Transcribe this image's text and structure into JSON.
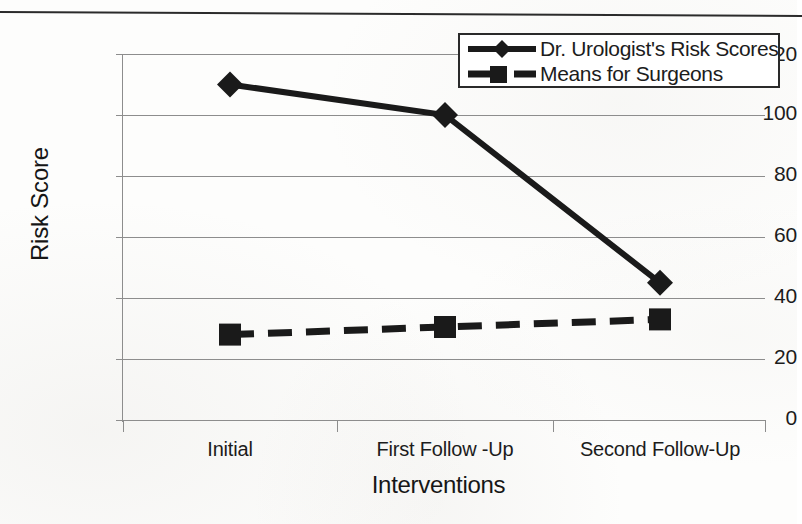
{
  "chart_data": {
    "type": "line",
    "title": "",
    "xlabel": "Interventions",
    "ylabel": "Risk Score",
    "categories": [
      "Initial",
      "First Follow -Up",
      "Second Follow-Up"
    ],
    "ylim": [
      0,
      120
    ],
    "yticks": [
      "0",
      "20",
      "40",
      "60",
      "80",
      "100",
      "120"
    ],
    "grid": "horizontal",
    "legend_position": "top-right",
    "series": [
      {
        "name": "Dr. Urologist's Risk Scores",
        "values": [
          110,
          100,
          45
        ],
        "marker": "diamond",
        "line_style": "solid",
        "color": "#1a1a1a"
      },
      {
        "name": "Means for Surgeons",
        "values": [
          28,
          30.5,
          33
        ],
        "marker": "square",
        "line_style": "dashed",
        "color": "#1a1a1a"
      }
    ]
  },
  "axes": {
    "y_label": "Risk Score",
    "x_label": "Interventions",
    "y_ticks": [
      {
        "label": "120",
        "value": 120
      },
      {
        "label": "100",
        "value": 100
      },
      {
        "label": "80",
        "value": 80
      },
      {
        "label": "60",
        "value": 60
      },
      {
        "label": "40",
        "value": 40
      },
      {
        "label": "20",
        "value": 20
      },
      {
        "label": "0",
        "value": 0
      }
    ],
    "x_ticks": [
      {
        "label": "Initial"
      },
      {
        "label": "First Follow -Up"
      },
      {
        "label": "Second Follow-Up"
      }
    ]
  },
  "legend": {
    "entries": [
      {
        "label": "Dr. Urologist's Risk Scores",
        "marker": "diamond-marker",
        "line": "solid"
      },
      {
        "label": "Means for Surgeons",
        "marker": "square-marker",
        "line": "dashed"
      }
    ]
  },
  "colors": {
    "ink": "#1a1a1a",
    "grid": "#8d8d8d",
    "page": "#fdfdfc"
  }
}
